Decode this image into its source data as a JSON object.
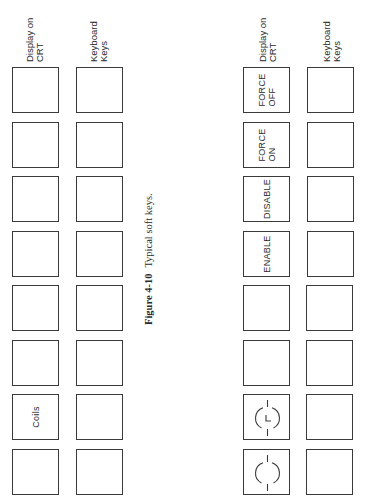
{
  "figure": {
    "number": "Figure 4-10",
    "caption": "Typical soft keys.",
    "orientation": "rotated 90° counterclockwise"
  },
  "panels": [
    {
      "headers": {
        "display": "Display on\nCRT",
        "keyboard": "Keyboard\nKeys"
      },
      "display_keys": [
        {
          "label": "",
          "icon": ""
        },
        {
          "label": "",
          "icon": ""
        },
        {
          "label": "",
          "icon": ""
        },
        {
          "label": "",
          "icon": ""
        },
        {
          "label": "",
          "icon": ""
        },
        {
          "label": "",
          "icon": ""
        },
        {
          "label": "Coils",
          "icon": ""
        },
        {
          "label": "",
          "icon": ""
        }
      ],
      "keyboard_keys": [
        "",
        "",
        "",
        "",
        "",
        "",
        "",
        ""
      ]
    },
    {
      "headers": {
        "display": "Display on\nCRT",
        "keyboard": "Keyboard\nKeys"
      },
      "display_keys": [
        {
          "label": "FORCE\nOFF",
          "icon": ""
        },
        {
          "label": "FORCE\nON",
          "icon": ""
        },
        {
          "label": "DISABLE",
          "icon": ""
        },
        {
          "label": "ENABLE",
          "icon": ""
        },
        {
          "label": "",
          "icon": ""
        },
        {
          "label": "",
          "icon": ""
        },
        {
          "label": "",
          "icon": "latched-coil-icon"
        },
        {
          "label": "",
          "icon": "coil-icon"
        }
      ],
      "keyboard_keys": [
        "",
        "",
        "",
        "",
        "",
        "",
        "",
        ""
      ]
    }
  ],
  "colors": {
    "stroke": "#3a3a3a",
    "text": "#2a2a2a",
    "background": "#ffffff"
  }
}
